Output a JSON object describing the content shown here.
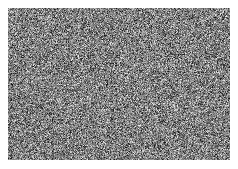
{
  "image": {
    "kind": "noise-field",
    "description": "Full-frame random grayscale pixel noise rectangle on a white page background",
    "canvas_width": 238,
    "canvas_height": 169,
    "background_color": "#ffffff",
    "text_present": false,
    "ui_chrome_present": false
  },
  "noise_panel": {
    "name": "grayscale-noise-rectangle",
    "left": 8,
    "top": 8,
    "width": 222,
    "height": 152,
    "mean_gray": "#808080",
    "min_gray": "#141414",
    "max_gray": "#ebebeb",
    "std_dev": 46,
    "grain_size_px": 1,
    "monochrome": true,
    "seed": 20240517
  },
  "margins": {
    "left": 8,
    "top": 8,
    "right": 8,
    "bottom": 9
  }
}
